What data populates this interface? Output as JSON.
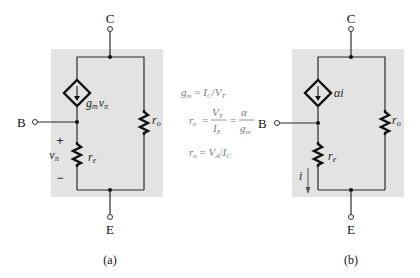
{
  "figure_a": {
    "caption": "(a)",
    "terminals": {
      "collector": "C",
      "base": "B",
      "emitter": "E"
    },
    "dependent_source": {
      "label_main": "g",
      "label_sub": "m",
      "label_var": "v",
      "label_var_sub": "π"
    },
    "resistors": {
      "re": {
        "main": "r",
        "sub": "e"
      },
      "ro": {
        "main": "r",
        "sub": "o"
      }
    },
    "voltage": {
      "main": "v",
      "sub": "π",
      "plus": "+",
      "minus": "−"
    }
  },
  "figure_b": {
    "caption": "(b)",
    "terminals": {
      "collector": "C",
      "base": "B",
      "emitter": "E"
    },
    "dependent_source": {
      "label": "αi"
    },
    "resistors": {
      "re": {
        "main": "r",
        "sub": "e"
      },
      "ro": {
        "main": "r",
        "sub": "o"
      }
    },
    "current": {
      "label": "i"
    }
  },
  "equations": {
    "gm": {
      "lhs": "g",
      "lhs_sub": "m",
      "eq": " = ",
      "num": "I",
      "num_sub": "C",
      "slash": "/",
      "den": "V",
      "den_sub": "T"
    },
    "re": {
      "lhs": "r",
      "lhs_sub": "e",
      "eq1": "=",
      "f1_num": "V",
      "f1_num_sub": "T",
      "f1_den": "I",
      "f1_den_sub": "E",
      "eq2": "=",
      "f2_num": "α",
      "f2_den": "g",
      "f2_den_sub": "m"
    },
    "ro": {
      "lhs": "r",
      "lhs_sub": "o",
      "eq": " = ",
      "num": "V",
      "num_sub": "A",
      "slash": "/",
      "den": "I",
      "den_sub": "C"
    }
  },
  "colors": {
    "panel": "#e3e3e3",
    "equation_text": "#7a7a7a",
    "wire": "#2a2a2a"
  }
}
